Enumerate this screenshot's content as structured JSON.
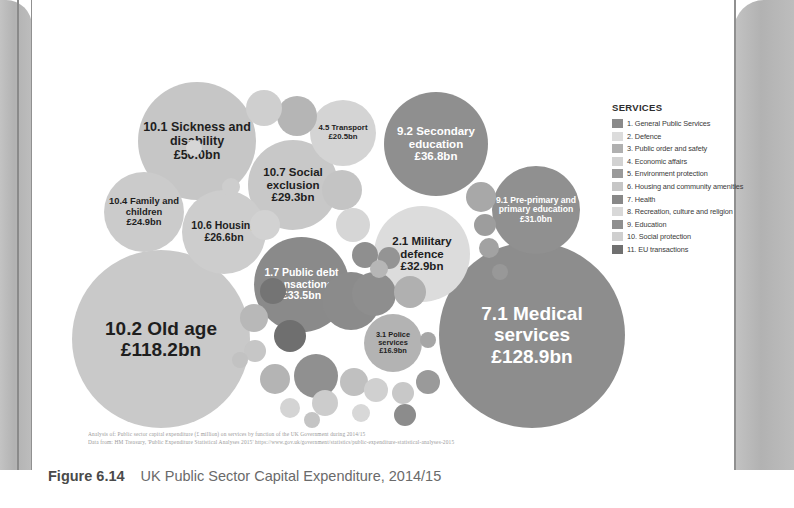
{
  "figure": {
    "label": "Figure 6.14",
    "title": "UK Public Sector Capital Expenditure, 2014/15"
  },
  "source": {
    "line1": "Analysis of: Public sector capital expenditure (£ million) on services by function of the UK Government during 2014/15",
    "line2": "Data from: HM Treasury, 'Public Expenditure Statistical Analyses 2015' https://www.gov.uk/government/statistics/public-expenditure-statistical-analyses-2015"
  },
  "legend": {
    "title": "SERVICES",
    "items": [
      {
        "label": "1. General Public Services",
        "color": "#8a8a8a"
      },
      {
        "label": "2. Defence",
        "color": "#dcdcdc"
      },
      {
        "label": "3. Public order and safety",
        "color": "#b0b0b0"
      },
      {
        "label": "4. Economic affairs",
        "color": "#d2d2d2"
      },
      {
        "label": "5. Environment protection",
        "color": "#9a9a9a"
      },
      {
        "label": "6. Housing and community amenities",
        "color": "#c6c6c6"
      },
      {
        "label": "7. Health",
        "color": "#888888"
      },
      {
        "label": "8. Recreation, culture and religion",
        "color": "#d8d8d8"
      },
      {
        "label": "9. Education",
        "color": "#8f8f8f"
      },
      {
        "label": "10. Social protection",
        "color": "#cfcfcf"
      },
      {
        "label": "11. EU transactions",
        "color": "#707070"
      }
    ]
  },
  "chart_data": {
    "type": "bubble",
    "title": "UK Public Sector Capital Expenditure, 2014/15",
    "unit": "£ billion",
    "xlabel": "",
    "ylabel": "",
    "grid": false,
    "legend_position": "right",
    "note": "Circle area is proportional to capital expenditure. Shade indicates service category.",
    "bubbles": [
      {
        "id": "10.2",
        "name": "10.2 Old age",
        "value_label": "£118.2bn",
        "value": 118.2,
        "category": 10,
        "color": "#c9c9c9",
        "text_color": "#1e1e1e",
        "x": 8,
        "y": 168,
        "d": 178,
        "font": 19,
        "val_font": 19,
        "labelled": true
      },
      {
        "id": "7.1",
        "name": "7.1 Medical services",
        "value_label": "£128.9bn",
        "value": 128.9,
        "category": 7,
        "color": "#8d8d8d",
        "text_color": "#ffffff",
        "x": 375,
        "y": 160,
        "d": 186,
        "font": 19,
        "val_font": 19,
        "labelled": true
      },
      {
        "id": "10.1",
        "name": "10.1 Sickness and disability",
        "value_label": "£50.0bn",
        "value": 50.0,
        "category": 10,
        "color": "#c6c6c6",
        "text_color": "#1e1e1e",
        "x": 74,
        "y": 0,
        "d": 118,
        "font": 12.5,
        "val_font": 12.5,
        "labelled": true
      },
      {
        "id": "9.2",
        "name": "9.2 Secondary education",
        "value_label": "£36.8bn",
        "value": 36.8,
        "category": 9,
        "color": "#8f8f8f",
        "text_color": "#ffffff",
        "x": 320,
        "y": 10,
        "d": 104,
        "font": 11.5,
        "val_font": 11.5,
        "labelled": true
      },
      {
        "id": "1.7",
        "name": "1.7 Public debt transactions",
        "value_label": "£33.5bn",
        "value": 33.5,
        "category": 1,
        "color": "#8a8a8a",
        "text_color": "#ffffff",
        "x": 190,
        "y": 155,
        "d": 95,
        "font": 10.5,
        "val_font": 10.5,
        "labelled": true
      },
      {
        "id": "2.1",
        "name": "2.1 Military defence",
        "value_label": "£32.9bn",
        "value": 32.9,
        "category": 2,
        "color": "#dcdcdc",
        "text_color": "#1e1e1e",
        "x": 310,
        "y": 124,
        "d": 96,
        "font": 11.5,
        "val_font": 11.5,
        "labelled": true
      },
      {
        "id": "9.1",
        "name": "9.1 Pre-primary and primary education",
        "value_label": "£31.0bn",
        "value": 31.0,
        "category": 9,
        "color": "#909090",
        "text_color": "#ffffff",
        "x": 428,
        "y": 84,
        "d": 88,
        "font": 8.6,
        "val_font": 8.6,
        "labelled": true
      },
      {
        "id": "10.7",
        "name": "10.7 Social exclusion",
        "value_label": "£29.3bn",
        "value": 29.3,
        "category": 10,
        "color": "#c8c8c8",
        "text_color": "#1e1e1e",
        "x": 184,
        "y": 58,
        "d": 90,
        "font": 11.5,
        "val_font": 11.5,
        "labelled": true
      },
      {
        "id": "10.6",
        "name": "10.6 Housing",
        "value_label": "£26.6bn",
        "value": 26.6,
        "category": 10,
        "color": "#cdcdcd",
        "text_color": "#1e1e1e",
        "x": 118,
        "y": 108,
        "d": 84,
        "font": 10.5,
        "val_font": 10.5,
        "labelled": true
      },
      {
        "id": "10.4",
        "name": "10.4 Family and children",
        "value_label": "£24.9bn",
        "value": 24.9,
        "category": 10,
        "color": "#cbcbcb",
        "text_color": "#1e1e1e",
        "x": 40,
        "y": 90,
        "d": 80,
        "font": 9.4,
        "val_font": 9.4,
        "labelled": true
      },
      {
        "id": "4.5",
        "name": "4.5 Transport",
        "value_label": "£20.5bn",
        "value": 20.5,
        "category": 4,
        "color": "#d4d4d4",
        "text_color": "#1e1e1e",
        "x": 246,
        "y": 18,
        "d": 66,
        "font": 7.8,
        "val_font": 7.8,
        "labelled": true
      },
      {
        "id": "3.1",
        "name": "3.1 Police services",
        "value_label": "£16.9bn",
        "value": 16.9,
        "category": 3,
        "color": "#b3b3b3",
        "text_color": "#1e1e1e",
        "x": 300,
        "y": 232,
        "d": 58,
        "font": 7.4,
        "val_font": 7.4,
        "labelled": true
      },
      {
        "id": "u01",
        "name": "",
        "value_label": "",
        "value": 9.0,
        "category": 4,
        "color": "#cfcfcf",
        "text_color": "#000000",
        "x": 182,
        "y": 8,
        "d": 36,
        "font": 0,
        "val_font": 0,
        "labelled": false
      },
      {
        "id": "u02",
        "name": "",
        "value_label": "",
        "value": 10.5,
        "category": 9,
        "color": "#b5b5b5",
        "text_color": "#000000",
        "x": 213,
        "y": 14,
        "d": 40,
        "font": 0,
        "val_font": 0,
        "labelled": false
      },
      {
        "id": "u03",
        "name": "",
        "value_label": "",
        "value": 8.0,
        "category": 6,
        "color": "#c4c4c4",
        "text_color": "#000000",
        "x": 258,
        "y": 88,
        "d": 40,
        "font": 0,
        "val_font": 0,
        "labelled": false
      },
      {
        "id": "u04",
        "name": "",
        "value_label": "",
        "value": 7.0,
        "category": 8,
        "color": "#d6d6d6",
        "text_color": "#000000",
        "x": 272,
        "y": 126,
        "d": 34,
        "font": 0,
        "val_font": 0,
        "labelled": false
      },
      {
        "id": "u05",
        "name": "",
        "value_label": "",
        "value": 6.0,
        "category": 5,
        "color": "#a8a8a8",
        "text_color": "#000000",
        "x": 402,
        "y": 100,
        "d": 30,
        "font": 0,
        "val_font": 0,
        "labelled": false
      },
      {
        "id": "u06",
        "name": "",
        "value_label": "",
        "value": 4.5,
        "category": 5,
        "color": "#9d9d9d",
        "text_color": "#000000",
        "x": 410,
        "y": 132,
        "d": 22,
        "font": 0,
        "val_font": 0,
        "labelled": false
      },
      {
        "id": "u07",
        "name": "",
        "value_label": "",
        "value": 4.0,
        "category": 5,
        "color": "#a2a2a2",
        "text_color": "#000000",
        "x": 415,
        "y": 156,
        "d": 20,
        "font": 0,
        "val_font": 0,
        "labelled": false
      },
      {
        "id": "u08",
        "name": "",
        "value_label": "",
        "value": 5.0,
        "category": 1,
        "color": "#8f8f8f",
        "text_color": "#000000",
        "x": 288,
        "y": 160,
        "d": 26,
        "font": 0,
        "val_font": 0,
        "labelled": false
      },
      {
        "id": "u09",
        "name": "",
        "value_label": "",
        "value": 4.0,
        "category": 1,
        "color": "#949494",
        "text_color": "#000000",
        "x": 314,
        "y": 165,
        "d": 22,
        "font": 0,
        "val_font": 0,
        "labelled": false
      },
      {
        "id": "u10",
        "name": "",
        "value_label": "",
        "value": 12.0,
        "category": 1,
        "color": "#8b8b8b",
        "text_color": "#000000",
        "x": 258,
        "y": 190,
        "d": 58,
        "font": 0,
        "val_font": 0,
        "labelled": false
      },
      {
        "id": "u11",
        "name": "",
        "value_label": "",
        "value": 8.0,
        "category": 11,
        "color": "#6f6f6f",
        "text_color": "#000000",
        "x": 210,
        "y": 238,
        "d": 32,
        "font": 0,
        "val_font": 0,
        "labelled": false
      },
      {
        "id": "u12",
        "name": "",
        "value_label": "",
        "value": 6.0,
        "category": 3,
        "color": "#b8b8b8",
        "text_color": "#000000",
        "x": 176,
        "y": 222,
        "d": 28,
        "font": 0,
        "val_font": 0,
        "labelled": false
      },
      {
        "id": "u13",
        "name": "",
        "value_label": "",
        "value": 5.0,
        "category": 6,
        "color": "#c6c6c6",
        "text_color": "#000000",
        "x": 180,
        "y": 258,
        "d": 22,
        "font": 0,
        "val_font": 0,
        "labelled": false
      },
      {
        "id": "u14",
        "name": "",
        "value_label": "",
        "value": 7.5,
        "category": 3,
        "color": "#b4b4b4",
        "text_color": "#000000",
        "x": 196,
        "y": 282,
        "d": 30,
        "font": 0,
        "val_font": 0,
        "labelled": false
      },
      {
        "id": "u15",
        "name": "",
        "value_label": "",
        "value": 9.0,
        "category": 1,
        "color": "#909090",
        "text_color": "#000000",
        "x": 230,
        "y": 272,
        "d": 44,
        "font": 0,
        "val_font": 0,
        "labelled": false
      },
      {
        "id": "u16",
        "name": "",
        "value_label": "",
        "value": 5.5,
        "category": 8,
        "color": "#cccccc",
        "text_color": "#000000",
        "x": 248,
        "y": 308,
        "d": 26,
        "font": 0,
        "val_font": 0,
        "labelled": false
      },
      {
        "id": "u17",
        "name": "",
        "value_label": "",
        "value": 6.0,
        "category": 6,
        "color": "#c0c0c0",
        "text_color": "#000000",
        "x": 276,
        "y": 286,
        "d": 28,
        "font": 0,
        "val_font": 0,
        "labelled": false
      },
      {
        "id": "u18",
        "name": "",
        "value_label": "",
        "value": 8.5,
        "category": 1,
        "color": "#8e8e8e",
        "text_color": "#000000",
        "x": 288,
        "y": 190,
        "d": 44,
        "font": 0,
        "val_font": 0,
        "labelled": false
      },
      {
        "id": "u19",
        "name": "",
        "value_label": "",
        "value": 7.0,
        "category": 3,
        "color": "#b0b0b0",
        "text_color": "#000000",
        "x": 330,
        "y": 194,
        "d": 32,
        "font": 0,
        "val_font": 0,
        "labelled": false
      },
      {
        "id": "u20",
        "name": "",
        "value_label": "",
        "value": 5.0,
        "category": 8,
        "color": "#d0d0d0",
        "text_color": "#000000",
        "x": 300,
        "y": 296,
        "d": 24,
        "font": 0,
        "val_font": 0,
        "labelled": false
      },
      {
        "id": "u21",
        "name": "",
        "value_label": "",
        "value": 4.0,
        "category": 6,
        "color": "#c8c8c8",
        "text_color": "#000000",
        "x": 328,
        "y": 300,
        "d": 22,
        "font": 0,
        "val_font": 0,
        "labelled": false
      },
      {
        "id": "u22",
        "name": "",
        "value_label": "",
        "value": 4.5,
        "category": 9,
        "color": "#9a9a9a",
        "text_color": "#000000",
        "x": 352,
        "y": 288,
        "d": 24,
        "font": 0,
        "val_font": 0,
        "labelled": false
      },
      {
        "id": "u23",
        "name": "",
        "value_label": "",
        "value": 3.5,
        "category": 4,
        "color": "#cdcdcd",
        "text_color": "#000000",
        "x": 158,
        "y": 96,
        "d": 18,
        "font": 0,
        "val_font": 0,
        "labelled": false
      },
      {
        "id": "u24",
        "name": "",
        "value_label": "",
        "value": 6.0,
        "category": 4,
        "color": "#d2d2d2",
        "text_color": "#000000",
        "x": 186,
        "y": 128,
        "d": 30,
        "font": 0,
        "val_font": 0,
        "labelled": false
      },
      {
        "id": "u25",
        "name": "",
        "value_label": "",
        "value": 5.0,
        "category": 11,
        "color": "#747474",
        "text_color": "#000000",
        "x": 196,
        "y": 196,
        "d": 26,
        "font": 0,
        "val_font": 0,
        "labelled": false
      },
      {
        "id": "u26",
        "name": "",
        "value_label": "",
        "value": 3.0,
        "category": 6,
        "color": "#c2c2c2",
        "text_color": "#000000",
        "x": 168,
        "y": 270,
        "d": 16,
        "font": 0,
        "val_font": 0,
        "labelled": false
      },
      {
        "id": "u27",
        "name": "",
        "value_label": "",
        "value": 4.0,
        "category": 8,
        "color": "#d4d4d4",
        "text_color": "#000000",
        "x": 216,
        "y": 316,
        "d": 20,
        "font": 0,
        "val_font": 0,
        "labelled": false
      },
      {
        "id": "u28",
        "name": "",
        "value_label": "",
        "value": 3.0,
        "category": 5,
        "color": "#a6a6a6",
        "text_color": "#000000",
        "x": 356,
        "y": 250,
        "d": 16,
        "font": 0,
        "val_font": 0,
        "labelled": false
      },
      {
        "id": "u29",
        "name": "",
        "value_label": "",
        "value": 3.5,
        "category": 3,
        "color": "#b6b6b6",
        "text_color": "#000000",
        "x": 306,
        "y": 178,
        "d": 18,
        "font": 0,
        "val_font": 0,
        "labelled": false
      },
      {
        "id": "u30",
        "name": "",
        "value_label": "",
        "value": 3.0,
        "category": 9,
        "color": "#989898",
        "text_color": "#000000",
        "x": 428,
        "y": 182,
        "d": 16,
        "font": 0,
        "val_font": 0,
        "labelled": false
      },
      {
        "id": "u31",
        "name": "",
        "value_label": "",
        "value": 4.0,
        "category": 8,
        "color": "#d8d8d8",
        "text_color": "#000000",
        "x": 288,
        "y": 322,
        "d": 18,
        "font": 0,
        "val_font": 0,
        "labelled": false
      },
      {
        "id": "u32",
        "name": "",
        "value_label": "",
        "value": 3.5,
        "category": 6,
        "color": "#c4c4c4",
        "text_color": "#000000",
        "x": 240,
        "y": 330,
        "d": 16,
        "font": 0,
        "val_font": 0,
        "labelled": false
      },
      {
        "id": "u33",
        "name": "",
        "value_label": "",
        "value": 5.0,
        "category": 7,
        "color": "#8c8c8c",
        "text_color": "#000000",
        "x": 330,
        "y": 322,
        "d": 22,
        "font": 0,
        "val_font": 0,
        "labelled": false
      },
      {
        "id": "u34",
        "name": "",
        "value_label": "",
        "value": 3.0,
        "category": 4,
        "color": "#d6d6d6",
        "text_color": "#000000",
        "x": 122,
        "y": 58,
        "d": 16,
        "font": 0,
        "val_font": 0,
        "labelled": false
      }
    ]
  }
}
